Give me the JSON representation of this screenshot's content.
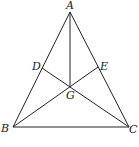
{
  "diagram": {
    "type": "geometry",
    "points": {
      "A": {
        "label": "A",
        "x": 70,
        "y": 12
      },
      "B": {
        "label": "B",
        "x": 13,
        "y": 127
      },
      "C": {
        "label": "C",
        "x": 129,
        "y": 127
      },
      "D": {
        "label": "D",
        "x": 42,
        "y": 68
      },
      "E": {
        "label": "E",
        "x": 98,
        "y": 67
      },
      "G": {
        "label": "G",
        "x": 70,
        "y": 86
      }
    },
    "segments": [
      "AB",
      "BC",
      "CA",
      "AG",
      "BE",
      "CD"
    ],
    "labels": {
      "A": "A",
      "B": "B",
      "C": "C",
      "D": "D",
      "E": "E",
      "G": "G"
    }
  }
}
